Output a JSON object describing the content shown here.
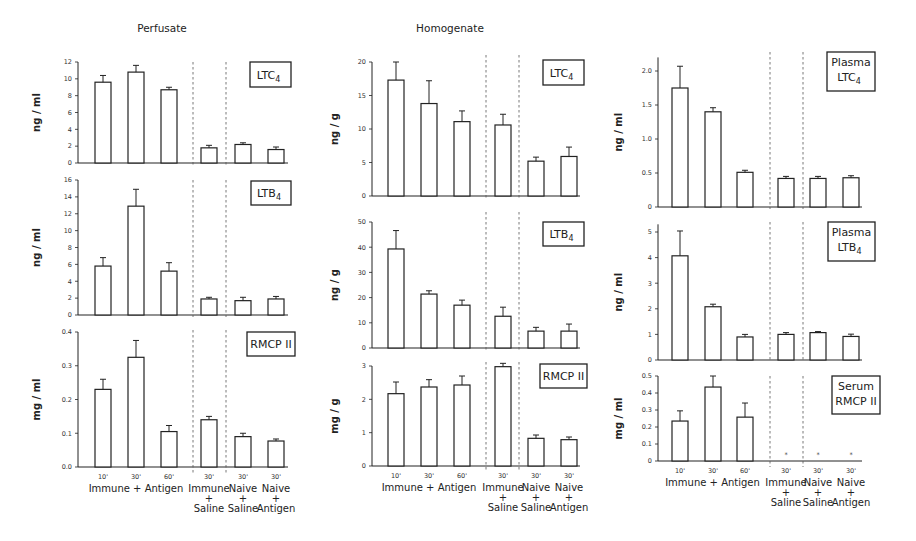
{
  "chart_data": [
    {
      "type": "bar",
      "panel": "Perfusate",
      "title": "Perfusate",
      "label": "LTC4",
      "ylabel": "ng / ml",
      "ylim": [
        0,
        12
      ],
      "yticks": [
        0,
        2,
        4,
        6,
        8,
        10,
        12
      ],
      "categories": [
        "10' Immune + Antigen",
        "30' Immune + Antigen",
        "60' Immune + Antigen",
        "30' Immune + Saline",
        "30' Naive + Saline",
        "30' Naive + Antigen"
      ],
      "values": [
        9.6,
        10.8,
        8.7,
        1.8,
        2.2,
        1.6
      ],
      "errors": [
        0.8,
        0.8,
        0.3,
        0.3,
        0.2,
        0.3
      ]
    },
    {
      "type": "bar",
      "panel": "Perfusate",
      "label": "LTB4",
      "ylabel": "ng / ml",
      "ylim": [
        0,
        16
      ],
      "yticks": [
        0,
        2,
        4,
        6,
        8,
        10,
        12,
        14,
        16
      ],
      "categories": [
        "10' Immune + Antigen",
        "30' Immune + Antigen",
        "60' Immune + Antigen",
        "30' Immune + Saline",
        "30' Naive + Saline",
        "30' Naive + Antigen"
      ],
      "values": [
        5.8,
        12.9,
        5.2,
        1.9,
        1.7,
        1.9
      ],
      "errors": [
        1.0,
        2.0,
        1.0,
        0.2,
        0.4,
        0.3
      ]
    },
    {
      "type": "bar",
      "panel": "Perfusate",
      "label": "RMCP II",
      "ylabel": "mg / ml",
      "ylim": [
        0,
        0.4
      ],
      "yticks": [
        "0.0",
        "0.1",
        "0.2",
        "0.3",
        "0.4"
      ],
      "categories": [
        "10' Immune + Antigen",
        "30' Immune + Antigen",
        "60' Immune + Antigen",
        "30' Immune + Saline",
        "30' Naive + Saline",
        "30' Naive + Antigen"
      ],
      "values": [
        0.23,
        0.325,
        0.105,
        0.14,
        0.09,
        0.077
      ],
      "errors": [
        0.03,
        0.05,
        0.018,
        0.01,
        0.01,
        0.006
      ]
    },
    {
      "type": "bar",
      "panel": "Homogenate",
      "title": "Homogenate",
      "label": "LTC4",
      "ylabel": "ng / g",
      "ylim": [
        0,
        20
      ],
      "yticks": [
        0,
        5,
        10,
        15,
        20
      ],
      "categories": [
        "10' Immune + Antigen",
        "30' Immune + Antigen",
        "60' Immune + Antigen",
        "30' Immune + Saline",
        "30' Naive + Saline",
        "30' Naive + Antigen"
      ],
      "values": [
        17.3,
        13.8,
        11.1,
        10.6,
        5.2,
        5.9
      ],
      "errors": [
        2.7,
        3.4,
        1.6,
        1.6,
        0.6,
        1.4
      ]
    },
    {
      "type": "bar",
      "panel": "Homogenate",
      "label": "LTB4",
      "ylabel": "ng / g",
      "ylim": [
        0,
        50
      ],
      "yticks": [
        0,
        10,
        20,
        30,
        40,
        50
      ],
      "categories": [
        "10' Immune + Antigen",
        "30' Immune + Antigen",
        "60' Immune + Antigen",
        "30' Immune + Saline",
        "30' Naive + Saline",
        "30' Naive + Antigen"
      ],
      "values": [
        39.3,
        21.4,
        17.0,
        12.6,
        6.7,
        6.7
      ],
      "errors": [
        7.3,
        1.3,
        2.0,
        3.6,
        1.5,
        2.8
      ]
    },
    {
      "type": "bar",
      "panel": "Homogenate",
      "label": "RMCP II",
      "ylabel": "mg / g",
      "ylim": [
        0,
        3
      ],
      "yticks": [
        0,
        1,
        2,
        3
      ],
      "categories": [
        "10' Immune + Antigen",
        "30' Immune + Antigen",
        "60' Immune + Antigen",
        "30' Immune + Saline",
        "30' Naive + Saline",
        "30' Naive + Antigen"
      ],
      "values": [
        2.17,
        2.37,
        2.43,
        2.98,
        0.83,
        0.79
      ],
      "errors": [
        0.35,
        0.22,
        0.27,
        0.1,
        0.1,
        0.08
      ]
    },
    {
      "type": "bar",
      "panel": "Plasma",
      "label": "Plasma LTC4",
      "ylabel": "ng / ml",
      "ylim": [
        0,
        2.2
      ],
      "yticks": [
        "0",
        "0.5",
        "1.0",
        "1.5",
        "2.0"
      ],
      "categories": [
        "10' Immune + Antigen",
        "30' Immune + Antigen",
        "60' Immune + Antigen",
        "30' Immune + Saline",
        "30' Naive + Saline",
        "30' Naive + Antigen"
      ],
      "values": [
        1.75,
        1.4,
        0.51,
        0.42,
        0.42,
        0.43
      ],
      "errors": [
        0.32,
        0.06,
        0.03,
        0.03,
        0.03,
        0.03
      ]
    },
    {
      "type": "bar",
      "panel": "Plasma",
      "label": "Plasma LTB4",
      "ylabel": "ng / ml",
      "ylim": [
        0,
        5.3
      ],
      "yticks": [
        0,
        1,
        2,
        3,
        4,
        5
      ],
      "categories": [
        "10' Immune + Antigen",
        "30' Immune + Antigen",
        "60' Immune + Antigen",
        "30' Immune + Saline",
        "30' Naive + Saline",
        "30' Naive + Antigen"
      ],
      "values": [
        4.07,
        2.08,
        0.9,
        1.0,
        1.07,
        0.92
      ],
      "errors": [
        0.97,
        0.1,
        0.1,
        0.07,
        0.04,
        0.09
      ]
    },
    {
      "type": "bar",
      "panel": "Plasma",
      "label": "Serum RMCP II",
      "ylabel": "mg / ml",
      "ylim": [
        0,
        0.5
      ],
      "yticks": [
        "0",
        "0.1",
        "0.2",
        "0.3",
        "0.4",
        "0.5"
      ],
      "categories": [
        "10' Immune + Antigen",
        "30' Immune + Antigen",
        "60' Immune + Antigen",
        "30' Immune + Saline",
        "30' Naive + Saline",
        "30' Naive + Antigen"
      ],
      "values": [
        0.235,
        0.435,
        0.258,
        0,
        0,
        0
      ],
      "errors": [
        0.06,
        0.065,
        0.083,
        0,
        0,
        0
      ],
      "annotations": [
        "* below detection for Immune+Saline, Naive+Saline, Naive+Antigen"
      ]
    }
  ],
  "titles": {
    "col1": "Perfusate",
    "col2": "Homogenate"
  },
  "box_labels": {
    "c1r1": "LTC",
    "c1r2": "LTB",
    "c1r3": "RMCP II",
    "c2r1": "LTC",
    "c2r2": "LTB",
    "c2r3": "RMCP II",
    "c3r1a": "Plasma",
    "c3r1b": "LTC",
    "c3r2a": "Plasma",
    "c3r2b": "LTB",
    "c3r3a": "Serum",
    "c3r3b": "RMCP II",
    "sub4": "4"
  },
  "ylabels": {
    "c1r1": "ng / ml",
    "c1r2": "ng / ml",
    "c1r3": "mg / ml",
    "c2r1": "ng / g",
    "c2r2": "ng / g",
    "c2r3": "mg / g",
    "c3r1": "ng / ml",
    "c3r2": "ng / ml",
    "c3r3": "mg / ml"
  },
  "xaxis": {
    "times": [
      "10'",
      "30'",
      "60'",
      "30'",
      "30'",
      "30'"
    ],
    "group1": "Immune + Antigen",
    "group2": [
      "Immune",
      "+",
      "Saline"
    ],
    "group3": [
      "Naive",
      "+",
      "Saline"
    ],
    "group4": [
      "Naive",
      "+",
      "Antigen"
    ]
  },
  "colors": {
    "ink": "#222222",
    "background": "#ffffff"
  }
}
